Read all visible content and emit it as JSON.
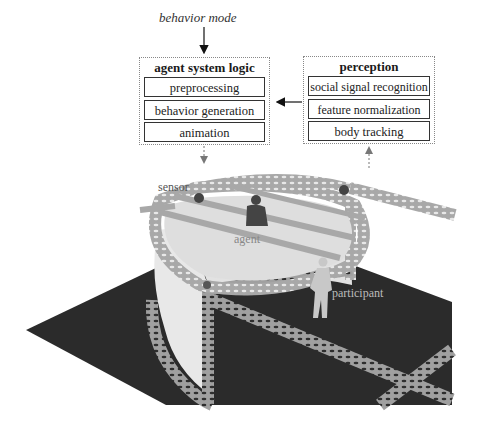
{
  "diagram": {
    "input_label": "behavior mode",
    "agent_logic": {
      "title": "agent system logic",
      "modules": [
        "preprocessing",
        "behavior generation",
        "animation"
      ]
    },
    "perception": {
      "title": "perception",
      "modules": [
        "social signal recognition",
        "feature normalization",
        "body tracking"
      ]
    },
    "scene_labels": {
      "sensor": "sensor",
      "agent": "agent",
      "participant": "participant"
    },
    "colors": {
      "floor": "#2b2b2b",
      "truss": "#a9a9a9",
      "screen": "#e6e6e6",
      "box_border": "#888888",
      "arrow_solid": "#111111",
      "arrow_dashed": "#777777"
    }
  }
}
